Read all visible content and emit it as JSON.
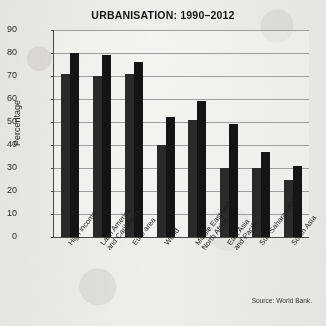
{
  "chart_data": {
    "type": "bar",
    "title": "URBANISATION: 1990–2012",
    "xlabel": "",
    "ylabel": "Percentage",
    "ylim": [
      0,
      90
    ],
    "ytick_step": 10,
    "yticks": [
      90,
      80,
      70,
      60,
      50,
      40,
      30,
      20,
      10,
      0
    ],
    "grid": true,
    "legend": "none",
    "source": "Source: World Bank.",
    "categories": [
      "High income",
      "Latin America\nand Caribbean",
      "Euro area",
      "World",
      "Middle East and\nNorth Africa",
      "East Asia\nand Pacific",
      "Sub-Saharan Africa",
      "South Asia"
    ],
    "series": [
      {
        "name": "1990",
        "values": [
          71,
          70,
          71,
          40,
          51,
          30,
          30,
          25
        ]
      },
      {
        "name": "2012",
        "values": [
          80,
          79,
          76,
          52,
          59,
          49,
          37,
          31
        ]
      }
    ],
    "bar_color_1990": "#2a2a2a",
    "bar_color_2012": "#141414"
  }
}
